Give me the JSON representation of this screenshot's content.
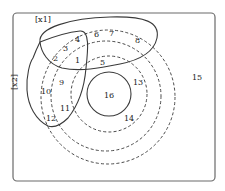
{
  "diagram": {
    "type": "euler-venn",
    "sets": {
      "x1": "[x1]",
      "x2": "[x2]"
    },
    "regions": {
      "r1": "1",
      "r2": "2",
      "r3": "3",
      "r4": "4",
      "r5": "5",
      "r6": "6",
      "r7": "7",
      "r8": "8",
      "r9": "9",
      "r10": "10",
      "r11": "11",
      "r12": "12",
      "r13": "13",
      "r14": "14",
      "r15": "15",
      "r16": "16"
    },
    "colors": {
      "stroke": "#3a3a3a",
      "frame": "#6a6a6a",
      "background": "#ffffff"
    }
  }
}
